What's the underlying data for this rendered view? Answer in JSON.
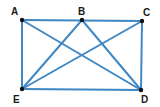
{
  "diagram": {
    "line_color": "#3f88c5",
    "point_color": "#111111",
    "points": [
      {
        "id": "A",
        "label": "A",
        "x": 22,
        "y": 20,
        "lx": 11,
        "ly": 15
      },
      {
        "id": "B",
        "label": "B",
        "x": 82,
        "y": 20,
        "lx": 78,
        "ly": 15
      },
      {
        "id": "C",
        "label": "C",
        "x": 142,
        "y": 21,
        "lx": 143,
        "ly": 16
      },
      {
        "id": "D",
        "label": "D",
        "x": 141,
        "y": 90,
        "lx": 141,
        "ly": 103
      },
      {
        "id": "E",
        "label": "E",
        "x": 22,
        "y": 89,
        "lx": 13,
        "ly": 103
      }
    ],
    "segments": [
      [
        "A",
        "C"
      ],
      [
        "C",
        "D"
      ],
      [
        "D",
        "E"
      ],
      [
        "E",
        "A"
      ],
      [
        "A",
        "D"
      ],
      [
        "B",
        "E"
      ],
      [
        "B",
        "D"
      ],
      [
        "C",
        "E"
      ]
    ]
  }
}
